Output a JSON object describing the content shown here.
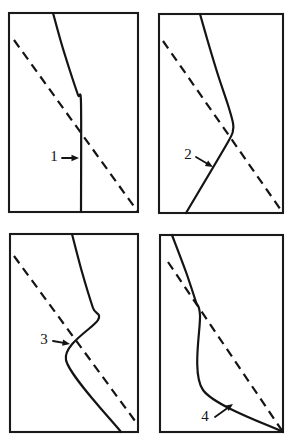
{
  "figure": {
    "width": 290,
    "height": 444,
    "background_color": "#ffffff",
    "ink_color": "#141414",
    "panel_count": 4,
    "grid": "2x2"
  },
  "chart_data": {
    "type": "line",
    "title": "",
    "xlabel": "",
    "ylabel": "",
    "grid": false,
    "legend": "none",
    "panels": [
      {
        "id": "panel-1",
        "label": "1",
        "frame": {
          "x": 9,
          "y": 13,
          "width": 129,
          "height": 199
        },
        "series": [
          {
            "name": "solid-curve",
            "style": "solid",
            "points": [
              [
                53,
                13
              ],
              [
                61,
                42
              ],
              [
                70,
                71
              ],
              [
                78,
                95
              ],
              [
                81,
                103
              ],
              [
                81,
                212
              ]
            ]
          },
          {
            "name": "dashed-reference-line",
            "style": "dashed",
            "points": [
              [
                14,
                40
              ],
              [
                138,
                212
              ]
            ]
          }
        ],
        "annotation": {
          "label": "1",
          "label_pos": [
            54,
            158
          ],
          "arrow_from": [
            62,
            158
          ],
          "arrow_to": [
            79,
            158
          ],
          "direction": "right"
        }
      },
      {
        "id": "panel-2",
        "label": "2",
        "frame": {
          "x": 159,
          "y": 14,
          "width": 124,
          "height": 199
        },
        "series": [
          {
            "name": "solid-curve",
            "style": "solid",
            "points": [
              [
                200,
                14
              ],
              [
                208,
                42
              ],
              [
                218,
                75
              ],
              [
                228,
                105
              ],
              [
                233,
                123
              ],
              [
                233,
                130
              ],
              [
                228,
                142
              ],
              [
                186,
                213
              ]
            ]
          },
          {
            "name": "dashed-reference-line",
            "style": "dashed",
            "points": [
              [
                163,
                41
              ],
              [
                283,
                213
              ]
            ]
          }
        ],
        "annotation": {
          "label": "2",
          "label_pos": [
            188,
            156
          ],
          "arrow_from": [
            196,
            157
          ],
          "arrow_to": [
            213,
            167
          ],
          "direction": "down-right"
        }
      },
      {
        "id": "panel-3",
        "label": "3",
        "frame": {
          "x": 10,
          "y": 234,
          "width": 128,
          "height": 198
        },
        "series": [
          {
            "name": "solid-curve",
            "style": "solid",
            "points": [
              [
                72,
                234
              ],
              [
                82,
                272
              ],
              [
                93,
                308
              ],
              [
                98,
                320
              ],
              [
                66,
                360
              ],
              [
                121,
                432
              ]
            ]
          },
          {
            "name": "dashed-reference-line",
            "style": "dashed",
            "points": [
              [
                14,
                256
              ],
              [
                138,
                425
              ]
            ]
          }
        ],
        "annotation": {
          "label": "3",
          "label_pos": [
            44,
            341
          ],
          "arrow_from": [
            53,
            341
          ],
          "arrow_to": [
            70,
            344
          ],
          "direction": "right"
        }
      },
      {
        "id": "panel-4",
        "label": "4",
        "frame": {
          "x": 160,
          "y": 235,
          "width": 123,
          "height": 197
        },
        "series": [
          {
            "name": "solid-curve",
            "style": "solid",
            "points": [
              [
                172,
                235
              ],
              [
                186,
                272
              ],
              [
                196,
                302
              ],
              [
                200,
                315
              ],
              [
                203,
                390
              ],
              [
                283,
                432
              ]
            ]
          },
          {
            "name": "dashed-reference-line",
            "style": "dashed",
            "points": [
              [
                168,
                262
              ],
              [
                283,
                432
              ]
            ]
          }
        ],
        "annotation": {
          "label": "4",
          "label_pos": [
            205,
            418
          ],
          "arrow_from": [
            215,
            417
          ],
          "arrow_to": [
            233,
            404
          ],
          "direction": "up-right"
        }
      }
    ]
  }
}
